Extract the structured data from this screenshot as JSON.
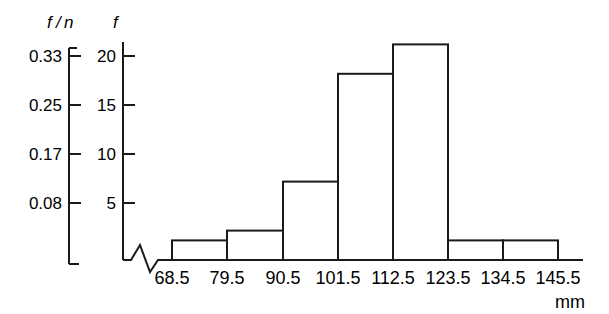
{
  "chart_data": {
    "type": "bar",
    "title": "",
    "subtitle": "",
    "xlabel": "mm",
    "ylabel": "f",
    "secondary_ylabel": "f/n",
    "categories": [
      "68.5-79.5",
      "79.5-90.5",
      "90.5-101.5",
      "101.5-112.5",
      "112.5-123.5",
      "123.5-134.5",
      "134.5-145.5"
    ],
    "bin_edges": [
      "68.5",
      "79.5",
      "90.5",
      "101.5",
      "112.5",
      "123.5",
      "134.5",
      "145.5"
    ],
    "values": [
      2,
      3,
      8,
      19,
      22,
      2,
      2
    ],
    "relative_values": [
      0.03,
      0.05,
      0.13,
      0.32,
      0.37,
      0.03,
      0.03
    ],
    "ylim": [
      0,
      24
    ],
    "yticks": [
      5,
      10,
      15,
      20
    ],
    "ytick_labels": [
      "5",
      "10",
      "15",
      "20"
    ],
    "secondary_yticks": [
      5,
      10,
      15,
      20
    ],
    "secondary_ytick_labels": [
      "0.08",
      "0.17",
      "0.25",
      "0.33"
    ],
    "grid": false,
    "legend": false,
    "axis_break": true,
    "bar_fill": "#ffffff",
    "bar_stroke": "#1a1a1a",
    "axis_color": "#1a1a1a"
  },
  "axes": {
    "freq_axis_title": "f",
    "relfreq_axis_title_numerator": "f",
    "relfreq_axis_title_slash": "/",
    "relfreq_axis_title_denominator": "n",
    "x_unit": "mm"
  },
  "relfreq_ticks": [
    {
      "label": "0.33",
      "value": 20
    },
    {
      "label": "0.25",
      "value": 15
    },
    {
      "label": "0.17",
      "value": 10
    },
    {
      "label": "0.08",
      "value": 5
    }
  ],
  "freq_ticks": [
    {
      "label": "20",
      "value": 20
    },
    {
      "label": "15",
      "value": 15
    },
    {
      "label": "10",
      "value": 10
    },
    {
      "label": "5",
      "value": 5
    }
  ],
  "x_ticks": [
    {
      "label": "68.5"
    },
    {
      "label": "79.5"
    },
    {
      "label": "90.5"
    },
    {
      "label": "101.5"
    },
    {
      "label": "112.5"
    },
    {
      "label": "123.5"
    },
    {
      "label": "134.5"
    },
    {
      "label": "145.5"
    }
  ]
}
